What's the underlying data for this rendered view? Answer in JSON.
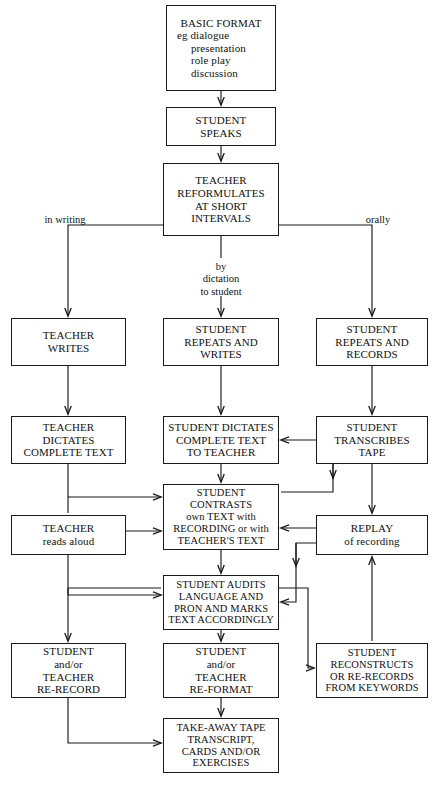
{
  "diagram": {
    "stroke_color": "#1a1a1a",
    "background_color": "#ffffff",
    "nodes": [
      {
        "id": "basic-format",
        "name": "node-basic-format",
        "lines": [
          "BASIC FORMAT",
          "eg  dialogue",
          "presentation",
          "role play",
          "discussion"
        ],
        "x": 166,
        "y": 5,
        "w": 110,
        "h": 86,
        "font_size": 11,
        "align": [
          "center",
          "left",
          "left",
          "left",
          "left"
        ],
        "indent": [
          0,
          0,
          14,
          14,
          14
        ]
      },
      {
        "id": "student-speaks",
        "name": "node-student-speaks",
        "lines": [
          "STUDENT",
          "SPEAKS"
        ],
        "x": 166,
        "y": 107,
        "w": 110,
        "h": 39,
        "font_size": 11
      },
      {
        "id": "teacher-reformulates",
        "name": "node-teacher-reformulates",
        "lines": [
          "TEACHER",
          "REFORMULATES",
          "AT SHORT",
          "INTERVALS"
        ],
        "x": 163,
        "y": 163,
        "w": 116,
        "h": 73,
        "font_size": 11
      },
      {
        "id": "teacher-writes",
        "name": "node-teacher-writes",
        "lines": [
          "TEACHER",
          "WRITES"
        ],
        "x": 11,
        "y": 318,
        "w": 115,
        "h": 48,
        "font_size": 11
      },
      {
        "id": "student-repeats-writes",
        "name": "node-student-repeats-and-writes",
        "lines": [
          "STUDENT",
          "REPEATS AND",
          "WRITES"
        ],
        "x": 163,
        "y": 318,
        "w": 116,
        "h": 48,
        "font_size": 11
      },
      {
        "id": "student-repeats-records",
        "name": "node-student-repeats-and-records",
        "lines": [
          "STUDENT",
          "REPEATS AND",
          "RECORDS"
        ],
        "x": 316,
        "y": 318,
        "w": 112,
        "h": 48,
        "font_size": 11
      },
      {
        "id": "teacher-dictates",
        "name": "node-teacher-dictates-complete-text",
        "lines": [
          "TEACHER",
          "DICTATES",
          "COMPLETE TEXT"
        ],
        "x": 11,
        "y": 416,
        "w": 115,
        "h": 48,
        "font_size": 11
      },
      {
        "id": "student-dictates",
        "name": "node-student-dictates-complete-text-to-teacher",
        "lines": [
          "STUDENT DICTATES",
          "COMPLETE TEXT",
          "TO TEACHER"
        ],
        "x": 163,
        "y": 416,
        "w": 116,
        "h": 48,
        "font_size": 11
      },
      {
        "id": "student-transcribes",
        "name": "node-student-transcribes-tape",
        "lines": [
          "STUDENT",
          "TRANSCRIBES",
          "TAPE"
        ],
        "x": 316,
        "y": 416,
        "w": 112,
        "h": 48,
        "font_size": 11
      },
      {
        "id": "student-contrasts",
        "name": "node-student-contrasts",
        "lines": [
          "STUDENT",
          "CONTRASTS",
          "own TEXT with",
          "RECORDING or with",
          "TEACHER'S TEXT"
        ],
        "x": 163,
        "y": 484,
        "w": 116,
        "h": 66,
        "font_size": 10.5
      },
      {
        "id": "teacher-reads-aloud",
        "name": "node-teacher-reads-aloud",
        "lines": [
          "TEACHER",
          "reads aloud"
        ],
        "x": 11,
        "y": 515,
        "w": 115,
        "h": 40,
        "font_size": 11
      },
      {
        "id": "replay",
        "name": "node-replay-of-recording",
        "lines": [
          "REPLAY",
          "of recording"
        ],
        "x": 316,
        "y": 515,
        "w": 112,
        "h": 40,
        "font_size": 11
      },
      {
        "id": "student-audits",
        "name": "node-student-audits-language",
        "lines": [
          "STUDENT AUDITS",
          "LANGUAGE AND",
          "PRON AND MARKS",
          "TEXT ACCORDINGLY"
        ],
        "x": 163,
        "y": 575,
        "w": 116,
        "h": 55,
        "font_size": 10.5
      },
      {
        "id": "student-teacher-rerecord",
        "name": "node-student-teacher-re-record",
        "lines": [
          "STUDENT",
          "and/or",
          "TEACHER",
          "RE-RECORD"
        ],
        "x": 11,
        "y": 643,
        "w": 115,
        "h": 55,
        "font_size": 11
      },
      {
        "id": "student-teacher-reformat",
        "name": "node-student-teacher-re-format",
        "lines": [
          "STUDENT",
          "and/or",
          "TEACHER",
          "RE-FORMAT"
        ],
        "x": 163,
        "y": 643,
        "w": 116,
        "h": 55,
        "font_size": 11
      },
      {
        "id": "student-reconstructs",
        "name": "node-student-reconstructs",
        "lines": [
          "STUDENT",
          "RECONSTRUCTS",
          "OR RE-RECORDS",
          "FROM KEYWORDS"
        ],
        "x": 316,
        "y": 643,
        "w": 112,
        "h": 55,
        "font_size": 10.5
      },
      {
        "id": "take-away-tape",
        "name": "node-take-away-tape",
        "lines": [
          "TAKE-AWAY TAPE",
          "TRANSCRIPT,",
          "CARDS AND/OR",
          "EXERCISES"
        ],
        "x": 163,
        "y": 718,
        "w": 116,
        "h": 55,
        "font_size": 10.5
      }
    ],
    "edge_labels": [
      {
        "id": "in-writing",
        "name": "edge-label-in-writing",
        "text": "in writing",
        "x": 36,
        "y": 214,
        "w": 58
      },
      {
        "id": "orally",
        "name": "edge-label-orally",
        "text": "orally",
        "x": 357,
        "y": 214,
        "w": 42
      },
      {
        "id": "by-dictation",
        "name": "edge-label-by-dictation-to-student",
        "text": "by\ndictation\nto student",
        "x": 186,
        "y": 261,
        "w": 70
      }
    ]
  }
}
